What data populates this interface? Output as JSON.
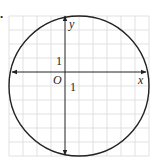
{
  "diagram": {
    "type": "coordinate-plane-circle",
    "axis_labels": {
      "x": "x",
      "y": "y",
      "origin": "O"
    },
    "tick_labels": {
      "x_unit": "1",
      "y_unit": "1"
    },
    "grid": {
      "spacing_px": 14,
      "origin_px": [
        65,
        72
      ],
      "x_range_units": [
        -4,
        6
      ],
      "y_range_units": [
        -6,
        4
      ]
    },
    "circle": {
      "center_units": [
        1,
        -1
      ],
      "radius_units": 5
    },
    "marker": "•",
    "colors": {
      "grid": "#d9d9d9",
      "axis": "#222222",
      "circle": "#222222"
    }
  }
}
